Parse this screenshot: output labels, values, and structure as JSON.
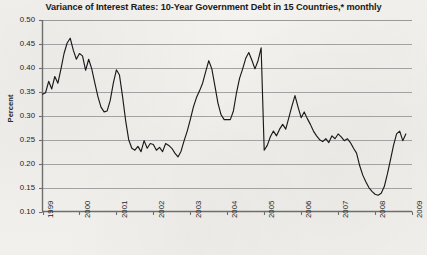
{
  "chart_data": {
    "type": "line",
    "title": "Variance of Interest Rates: 10-Year Government Debt in 15 Countries,* monthly",
    "xlabel": "",
    "ylabel": "Percent",
    "ylim": [
      0.1,
      0.5
    ],
    "xlim": [
      1999.0,
      2009.0
    ],
    "ytick_labels": [
      "0.50",
      "0.45",
      "0.40",
      "0.35",
      "0.30",
      "0.25",
      "0.20",
      "0.15",
      "0.10"
    ],
    "ytick_values": [
      0.5,
      0.45,
      0.4,
      0.35,
      0.3,
      0.25,
      0.2,
      0.15,
      0.1
    ],
    "xtick_labels": [
      "1999",
      "2000",
      "2001",
      "2002",
      "2003",
      "2004",
      "2005",
      "2006",
      "2007",
      "2008",
      "2009"
    ],
    "xtick_values": [
      1999,
      2000,
      2001,
      2002,
      2003,
      2004,
      2005,
      2006,
      2007,
      2008,
      2009
    ],
    "grid": "horizontal",
    "legend": "none",
    "line_color": "#1a1a1a",
    "background_color": "#f2f1ed",
    "axis_color": "#6e6e6e",
    "grid_color": "#9a9a9a",
    "frequency": "monthly",
    "series": [
      {
        "name": "Variance of interest rates",
        "x": [
          1999.0,
          1999.083,
          1999.167,
          1999.25,
          1999.333,
          1999.417,
          1999.5,
          1999.583,
          1999.667,
          1999.75,
          1999.833,
          1999.917,
          2000.0,
          2000.083,
          2000.167,
          2000.25,
          2000.333,
          2000.417,
          2000.5,
          2000.583,
          2000.667,
          2000.75,
          2000.833,
          2000.917,
          2001.0,
          2001.083,
          2001.167,
          2001.25,
          2001.333,
          2001.417,
          2001.5,
          2001.583,
          2001.667,
          2001.75,
          2001.833,
          2001.917,
          2002.0,
          2002.083,
          2002.167,
          2002.25,
          2002.333,
          2002.417,
          2002.5,
          2002.583,
          2002.667,
          2002.75,
          2002.833,
          2002.917,
          2003.0,
          2003.083,
          2003.167,
          2003.25,
          2003.333,
          2003.417,
          2003.5,
          2003.583,
          2003.667,
          2003.75,
          2003.833,
          2003.917,
          2004.0,
          2004.083,
          2004.167,
          2004.25,
          2004.333,
          2004.417,
          2004.5,
          2004.583,
          2004.667,
          2004.75,
          2004.833,
          2004.917,
          2005.0,
          2005.083,
          2005.167,
          2005.25,
          2005.333,
          2005.417,
          2005.5,
          2005.583,
          2005.667,
          2005.75,
          2005.833,
          2005.917,
          2006.0,
          2006.083,
          2006.167,
          2006.25,
          2006.333,
          2006.417,
          2006.5,
          2006.583,
          2006.667,
          2006.75,
          2006.833,
          2006.917,
          2007.0,
          2007.083,
          2007.167,
          2007.25,
          2007.333,
          2007.417,
          2007.5,
          2007.583,
          2007.667,
          2007.75,
          2007.833,
          2007.917,
          2008.0,
          2008.083,
          2008.167,
          2008.25,
          2008.333,
          2008.417,
          2008.5,
          2008.583,
          2008.667,
          2008.75,
          2008.833,
          2008.917
        ],
        "values": [
          0.345,
          0.348,
          0.372,
          0.356,
          0.382,
          0.368,
          0.398,
          0.43,
          0.452,
          0.462,
          0.437,
          0.418,
          0.43,
          0.425,
          0.395,
          0.418,
          0.398,
          0.368,
          0.34,
          0.318,
          0.308,
          0.31,
          0.332,
          0.368,
          0.396,
          0.385,
          0.34,
          0.29,
          0.25,
          0.232,
          0.228,
          0.236,
          0.225,
          0.248,
          0.232,
          0.242,
          0.24,
          0.228,
          0.234,
          0.225,
          0.242,
          0.238,
          0.232,
          0.222,
          0.214,
          0.226,
          0.248,
          0.268,
          0.292,
          0.318,
          0.338,
          0.352,
          0.368,
          0.392,
          0.415,
          0.398,
          0.362,
          0.326,
          0.302,
          0.292,
          0.292,
          0.292,
          0.31,
          0.348,
          0.378,
          0.398,
          0.42,
          0.432,
          0.416,
          0.398,
          0.415,
          0.442,
          0.46,
          0.466,
          0.452,
          0.428,
          0.398,
          0.368,
          0.338,
          0.312,
          0.288,
          0.265,
          0.248,
          0.238,
          0.25,
          0.248,
          0.235,
          0.222,
          0.228,
          0.242,
          0.252,
          0.25,
          0.238,
          0.225,
          0.222,
          0.226,
          0.248,
          0.252,
          0.242,
          0.226,
          0.218,
          0.212,
          0.222,
          0.235,
          0.248,
          0.252,
          0.244,
          0.228,
          0.222,
          0.224,
          0.228,
          0.226,
          0.222,
          0.226,
          0.234,
          0.236,
          0.23,
          0.226,
          0.228,
          0.232
        ]
      }
    ],
    "series_tail": {
      "name": "Variance of interest rates (2005-2009 continuation)",
      "x": [
        2005.0,
        2005.083,
        2005.167,
        2005.25,
        2005.333,
        2005.417,
        2005.5,
        2005.583,
        2005.667,
        2005.75,
        2005.833,
        2005.917,
        2006.0,
        2006.083,
        2006.167,
        2006.25,
        2006.333,
        2006.417,
        2006.5,
        2006.583,
        2006.667,
        2006.75,
        2006.833,
        2006.917,
        2007.0,
        2007.083,
        2007.167,
        2007.25,
        2007.333,
        2007.417,
        2007.5,
        2007.583,
        2007.667,
        2007.75,
        2007.833,
        2007.917,
        2008.0,
        2008.083,
        2008.167,
        2008.25,
        2008.333,
        2008.417,
        2008.5,
        2008.583,
        2008.667,
        2008.75,
        2008.833
      ],
      "values": [
        0.228,
        0.238,
        0.256,
        0.268,
        0.258,
        0.272,
        0.282,
        0.272,
        0.296,
        0.32,
        0.342,
        0.318,
        0.296,
        0.308,
        0.294,
        0.282,
        0.268,
        0.258,
        0.25,
        0.246,
        0.252,
        0.244,
        0.258,
        0.252,
        0.262,
        0.256,
        0.248,
        0.252,
        0.244,
        0.232,
        0.222,
        0.196,
        0.176,
        0.162,
        0.15,
        0.142,
        0.136,
        0.134,
        0.138,
        0.152,
        0.178,
        0.208,
        0.238,
        0.262,
        0.268,
        0.248,
        0.262
      ]
    },
    "annotations": {
      "footnote_marker": "*",
      "peak_value": 0.466,
      "peak_period": "2002-2003",
      "trough_value": 0.134,
      "trough_period": "2008",
      "start_value": 0.345,
      "end_value": 0.262
    }
  }
}
